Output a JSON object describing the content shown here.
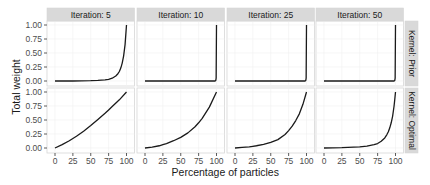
{
  "chart_data": {
    "type": "line",
    "title": "",
    "xlabel": "Percentage of particles",
    "ylabel": "Total weight",
    "xlim": [
      0,
      100
    ],
    "ylim": [
      0,
      1
    ],
    "x_ticks": [
      0,
      25,
      50,
      75,
      100
    ],
    "x_tick_labels": [
      "0",
      "25",
      "50",
      "75",
      "100"
    ],
    "y_ticks": [
      0,
      0.25,
      0.5,
      0.75,
      1.0
    ],
    "y_tick_labels": [
      "0.00",
      "0.25",
      "0.50",
      "0.75",
      "1.00"
    ],
    "grid": true,
    "legend": "none",
    "facet_columns": [
      "Iteration: 5",
      "Iteration: 10",
      "Iteration: 25",
      "Iteration: 50"
    ],
    "facet_rows": [
      "Kernel: Prior",
      "Kernel: Optimal"
    ],
    "panels": [
      {
        "row": "Kernel: Prior",
        "col": "Iteration: 5",
        "x": [
          0,
          25,
          50,
          60,
          70,
          75,
          80,
          85,
          88,
          90,
          92,
          94,
          96,
          98,
          100
        ],
        "y": [
          0,
          0.0,
          0.005,
          0.01,
          0.02,
          0.03,
          0.05,
          0.09,
          0.13,
          0.17,
          0.23,
          0.32,
          0.45,
          0.65,
          1.0
        ]
      },
      {
        "row": "Kernel: Prior",
        "col": "Iteration: 10",
        "x": [
          0,
          50,
          98,
          99,
          99.5,
          100
        ],
        "y": [
          0,
          0,
          0.0,
          0.01,
          0.05,
          1.0
        ]
      },
      {
        "row": "Kernel: Prior",
        "col": "Iteration: 25",
        "x": [
          0,
          50,
          98,
          99,
          99.5,
          100
        ],
        "y": [
          0,
          0,
          0.0,
          0.01,
          0.05,
          1.0
        ]
      },
      {
        "row": "Kernel: Prior",
        "col": "Iteration: 50",
        "x": [
          0,
          50,
          98,
          99,
          99.5,
          100
        ],
        "y": [
          0,
          0,
          0.0,
          0.01,
          0.05,
          1.0
        ]
      },
      {
        "row": "Kernel: Optimal",
        "col": "Iteration: 5",
        "x": [
          0,
          10,
          20,
          25,
          30,
          40,
          50,
          60,
          70,
          75,
          80,
          90,
          100
        ],
        "y": [
          0,
          0.06,
          0.13,
          0.17,
          0.21,
          0.3,
          0.4,
          0.51,
          0.62,
          0.68,
          0.74,
          0.86,
          1.0
        ]
      },
      {
        "row": "Kernel: Optimal",
        "col": "Iteration: 10",
        "x": [
          0,
          10,
          20,
          25,
          30,
          40,
          50,
          60,
          70,
          75,
          80,
          90,
          100
        ],
        "y": [
          0,
          0.015,
          0.04,
          0.06,
          0.08,
          0.13,
          0.19,
          0.27,
          0.38,
          0.45,
          0.53,
          0.73,
          1.0
        ]
      },
      {
        "row": "Kernel: Optimal",
        "col": "Iteration: 25",
        "x": [
          0,
          10,
          20,
          25,
          30,
          40,
          50,
          60,
          70,
          75,
          80,
          85,
          90,
          95,
          100
        ],
        "y": [
          0,
          0.01,
          0.02,
          0.03,
          0.04,
          0.065,
          0.1,
          0.15,
          0.24,
          0.31,
          0.39,
          0.49,
          0.61,
          0.78,
          1.0
        ]
      },
      {
        "row": "Kernel: Optimal",
        "col": "Iteration: 50",
        "x": [
          0,
          25,
          50,
          60,
          70,
          75,
          80,
          85,
          88,
          90,
          92,
          94,
          96,
          98,
          99,
          100
        ],
        "y": [
          0,
          0.005,
          0.02,
          0.035,
          0.06,
          0.08,
          0.12,
          0.18,
          0.24,
          0.29,
          0.36,
          0.45,
          0.57,
          0.75,
          0.87,
          1.0
        ]
      }
    ],
    "colors": {
      "line": "#1a1a1a",
      "panel_background": "#ffffff",
      "panel_border": "#d6d6d6",
      "grid": "#f0f0f0",
      "strip_background": "#d9d9d9",
      "strip_border": "#bdbdbd",
      "tick": "#4d4d4d"
    }
  }
}
